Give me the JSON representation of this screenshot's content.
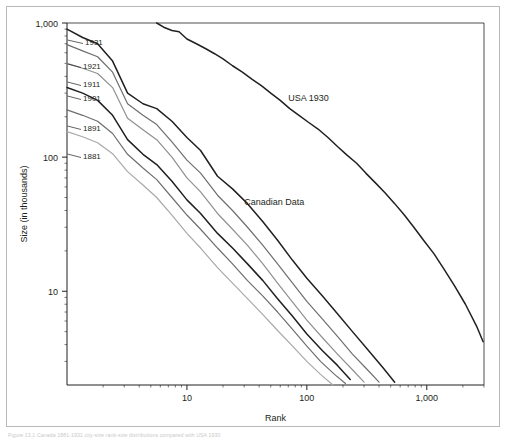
{
  "figure": {
    "caption": "Figure 13.1   Canada 1881-1931 city-size rank-size distributions compared with USA 1930"
  },
  "chart_data": {
    "type": "line",
    "title": "",
    "xlabel": "Rank",
    "ylabel": "Size (in thousands)",
    "xscale": "log",
    "yscale": "log",
    "xlim": [
      1,
      3000
    ],
    "ylim": [
      2,
      1000
    ],
    "xticks": [
      "10",
      "100",
      "1,000"
    ],
    "xtick_values": [
      10,
      100,
      1000
    ],
    "yticks": [
      "1,000",
      "100",
      "10"
    ],
    "ytick_values": [
      1000,
      100,
      10
    ],
    "grid": false,
    "legend": "inline-annotations",
    "annotations": [
      {
        "text": "USA 1930",
        "x": 70,
        "y": 260
      },
      {
        "text": "Canadian Data",
        "x": 30,
        "y": 44
      }
    ],
    "series": [
      {
        "name": "1931",
        "color": "#231f20",
        "label": "1931",
        "points": [
          [
            1,
            900
          ],
          [
            1.35,
            780
          ],
          [
            1.8,
            700
          ],
          [
            2.4,
            520
          ],
          [
            3.2,
            300
          ],
          [
            4.3,
            250
          ],
          [
            5.6,
            230
          ],
          [
            7.5,
            185
          ],
          [
            10,
            140
          ],
          [
            13,
            112
          ],
          [
            18,
            72
          ],
          [
            24,
            58
          ],
          [
            32,
            45
          ],
          [
            43,
            33
          ],
          [
            57,
            24
          ],
          [
            76,
            17
          ],
          [
            100,
            12.5
          ],
          [
            135,
            9.2
          ],
          [
            180,
            6.8
          ],
          [
            240,
            5.0
          ],
          [
            320,
            3.7
          ],
          [
            430,
            2.7
          ],
          [
            540,
            2.1
          ]
        ]
      },
      {
        "name": "1921",
        "color": "#6d6e70",
        "label": "1921",
        "points": [
          [
            1,
            690
          ],
          [
            1.35,
            620
          ],
          [
            1.8,
            560
          ],
          [
            2.4,
            430
          ],
          [
            3.2,
            250
          ],
          [
            4.3,
            205
          ],
          [
            5.6,
            175
          ],
          [
            7.5,
            130
          ],
          [
            10,
            95
          ],
          [
            13,
            76
          ],
          [
            18,
            52
          ],
          [
            24,
            40
          ],
          [
            32,
            30
          ],
          [
            43,
            22
          ],
          [
            57,
            16
          ],
          [
            76,
            11.5
          ],
          [
            100,
            8.4
          ],
          [
            135,
            6.2
          ],
          [
            180,
            4.6
          ],
          [
            240,
            3.4
          ],
          [
            320,
            2.6
          ],
          [
            400,
            2.1
          ]
        ]
      },
      {
        "name": "1911",
        "color": "#8e9091",
        "label": "1911",
        "points": [
          [
            1,
            500
          ],
          [
            1.35,
            460
          ],
          [
            1.8,
            420
          ],
          [
            2.4,
            330
          ],
          [
            3.2,
            195
          ],
          [
            4.3,
            160
          ],
          [
            5.6,
            135
          ],
          [
            7.5,
            100
          ],
          [
            10,
            70
          ],
          [
            13,
            55
          ],
          [
            18,
            38
          ],
          [
            24,
            29
          ],
          [
            32,
            22
          ],
          [
            43,
            16
          ],
          [
            57,
            11.5
          ],
          [
            76,
            8.3
          ],
          [
            100,
            6.1
          ],
          [
            135,
            4.5
          ],
          [
            180,
            3.4
          ],
          [
            240,
            2.6
          ],
          [
            300,
            2.1
          ]
        ]
      },
      {
        "name": "1901",
        "color": "#231f20",
        "label": "1901",
        "points": [
          [
            1,
            330
          ],
          [
            1.35,
            300
          ],
          [
            1.8,
            265
          ],
          [
            2.4,
            205
          ],
          [
            3.2,
            135
          ],
          [
            4.3,
            105
          ],
          [
            5.6,
            88
          ],
          [
            7.5,
            66
          ],
          [
            10,
            48
          ],
          [
            13,
            38
          ],
          [
            18,
            27
          ],
          [
            24,
            21
          ],
          [
            32,
            16
          ],
          [
            43,
            12
          ],
          [
            57,
            8.8
          ],
          [
            76,
            6.5
          ],
          [
            100,
            4.8
          ],
          [
            135,
            3.6
          ],
          [
            180,
            2.8
          ],
          [
            230,
            2.2
          ]
        ]
      },
      {
        "name": "1891",
        "color": "#6d6e70",
        "label": "1891",
        "points": [
          [
            1,
            225
          ],
          [
            1.35,
            205
          ],
          [
            1.8,
            185
          ],
          [
            2.4,
            150
          ],
          [
            3.2,
            105
          ],
          [
            4.3,
            83
          ],
          [
            5.6,
            68
          ],
          [
            7.5,
            50
          ],
          [
            10,
            37
          ],
          [
            13,
            29
          ],
          [
            18,
            21
          ],
          [
            24,
            16
          ],
          [
            32,
            12
          ],
          [
            43,
            9.2
          ],
          [
            57,
            7.0
          ],
          [
            76,
            5.2
          ],
          [
            100,
            3.9
          ],
          [
            130,
            3.0
          ],
          [
            170,
            2.4
          ],
          [
            210,
            2.05
          ]
        ]
      },
      {
        "name": "1881",
        "color": "#a7a9ac",
        "label": "1881",
        "points": [
          [
            1,
            155
          ],
          [
            1.35,
            142
          ],
          [
            1.8,
            128
          ],
          [
            2.4,
            106
          ],
          [
            3.2,
            78
          ],
          [
            4.3,
            62
          ],
          [
            5.6,
            50
          ],
          [
            7.5,
            37
          ],
          [
            10,
            27
          ],
          [
            13,
            21
          ],
          [
            18,
            15
          ],
          [
            24,
            11.5
          ],
          [
            32,
            8.8
          ],
          [
            43,
            6.7
          ],
          [
            57,
            5.1
          ],
          [
            76,
            3.9
          ],
          [
            100,
            3.0
          ],
          [
            130,
            2.4
          ],
          [
            165,
            2.0
          ]
        ]
      },
      {
        "name": "USA 1930",
        "color": "#231f20",
        "label": "USA 1930",
        "points": [
          [
            5.6,
            1000
          ],
          [
            6.4,
            930
          ],
          [
            7.5,
            880
          ],
          [
            8.6,
            860
          ],
          [
            10,
            760
          ],
          [
            12,
            700
          ],
          [
            14.5,
            640
          ],
          [
            17,
            590
          ],
          [
            20,
            540
          ],
          [
            24,
            480
          ],
          [
            29,
            430
          ],
          [
            35,
            380
          ],
          [
            42,
            340
          ],
          [
            50,
            300
          ],
          [
            60,
            265
          ],
          [
            72,
            230
          ],
          [
            86,
            205
          ],
          [
            103,
            182
          ],
          [
            124,
            162
          ],
          [
            150,
            140
          ],
          [
            180,
            120
          ],
          [
            215,
            104
          ],
          [
            260,
            90
          ],
          [
            310,
            76
          ],
          [
            375,
            64
          ],
          [
            450,
            54
          ],
          [
            540,
            45
          ],
          [
            650,
            37
          ],
          [
            780,
            30
          ],
          [
            940,
            24
          ],
          [
            1150,
            19
          ],
          [
            1400,
            14.5
          ],
          [
            1700,
            11
          ],
          [
            2100,
            8
          ],
          [
            2600,
            5.5
          ],
          [
            2950,
            4.2
          ]
        ]
      }
    ],
    "series_labels": [
      {
        "name": "1931",
        "x": 78,
        "y": 38
      },
      {
        "name": "1921",
        "x": 76,
        "y": 62
      },
      {
        "name": "1911",
        "x": 76,
        "y": 80
      },
      {
        "name": "1901",
        "x": 76,
        "y": 94
      },
      {
        "name": "1891",
        "x": 76,
        "y": 124
      },
      {
        "name": "1881",
        "x": 76,
        "y": 152
      }
    ]
  }
}
